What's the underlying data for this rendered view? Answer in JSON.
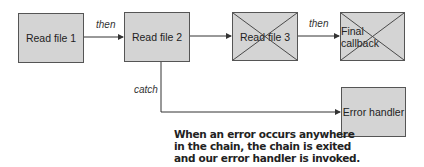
{
  "nodes": {
    "read_file_1": {
      "label": "Read file 1",
      "cancelled": false
    },
    "read_file_2": {
      "label": "Read file 2",
      "cancelled": false
    },
    "read_file_3": {
      "label": "Read file 3",
      "cancelled": true
    },
    "final_callback": {
      "label": "Final callback",
      "cancelled": true
    },
    "error_handler": {
      "label": "Error handler",
      "cancelled": false
    }
  },
  "edges": {
    "e1": {
      "from": "read_file_1",
      "to": "read_file_2",
      "label": "then"
    },
    "e2": {
      "from": "read_file_2",
      "to": "read_file_3",
      "label": ""
    },
    "e3": {
      "from": "read_file_3",
      "to": "final_callback",
      "label": "then"
    },
    "e4": {
      "from": "read_file_2",
      "to": "error_handler",
      "label": "catch"
    }
  },
  "caption": {
    "line1": "When an error occurs anywhere",
    "line2": "in the chain, the chain is exited",
    "line3": "and our error handler is invoked."
  },
  "colors": {
    "box_fill": "#d4d4d4",
    "box_border": "#555555",
    "line": "#333333"
  }
}
